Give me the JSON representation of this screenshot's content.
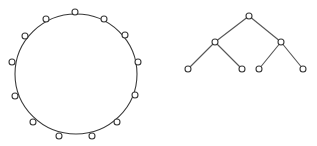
{
  "figure": {
    "width": 317,
    "height": 146,
    "colors": {
      "stroke": "#3a3a3a",
      "edge": "#555555",
      "background": "#ffffff",
      "node_fill": "#ffffff"
    }
  },
  "ring_graph": {
    "label": "ring topology",
    "circle": {
      "cx": 76,
      "cy": 74,
      "rx": 61,
      "ry": 60
    },
    "node_radius": 3,
    "nodes": [
      {
        "x": 75,
        "y": 12
      },
      {
        "x": 104,
        "y": 19
      },
      {
        "x": 125,
        "y": 35
      },
      {
        "x": 138,
        "y": 62
      },
      {
        "x": 135,
        "y": 95
      },
      {
        "x": 117,
        "y": 122
      },
      {
        "x": 92,
        "y": 136
      },
      {
        "x": 59,
        "y": 136
      },
      {
        "x": 33,
        "y": 122
      },
      {
        "x": 15,
        "y": 96
      },
      {
        "x": 12,
        "y": 62
      },
      {
        "x": 25,
        "y": 36
      },
      {
        "x": 46,
        "y": 19
      }
    ]
  },
  "tree_graph": {
    "label": "binary tree",
    "node_radius": 3,
    "nodes": [
      {
        "id": "root",
        "x": 249,
        "y": 16
      },
      {
        "id": "left",
        "x": 215,
        "y": 42
      },
      {
        "id": "right",
        "x": 281,
        "y": 42
      },
      {
        "id": "left-left",
        "x": 188,
        "y": 69
      },
      {
        "id": "left-right",
        "x": 242,
        "y": 69
      },
      {
        "id": "right-left",
        "x": 259,
        "y": 69
      },
      {
        "id": "right-right",
        "x": 303,
        "y": 69
      }
    ],
    "edges": [
      [
        "root",
        "left"
      ],
      [
        "root",
        "right"
      ],
      [
        "left",
        "left-left"
      ],
      [
        "left",
        "left-right"
      ],
      [
        "right",
        "right-left"
      ],
      [
        "right",
        "right-right"
      ]
    ]
  }
}
